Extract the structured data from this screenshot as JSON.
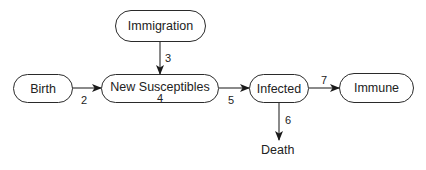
{
  "diagram": {
    "nodes": [
      {
        "id": "birth",
        "label": "Birth"
      },
      {
        "id": "immigration",
        "label": "Immigration"
      },
      {
        "id": "new_susceptibles",
        "label": "New Susceptibles"
      },
      {
        "id": "infected",
        "label": "Infected"
      },
      {
        "id": "immune",
        "label": "Immune"
      },
      {
        "id": "death",
        "label": "Death"
      }
    ],
    "edges": [
      {
        "from": "birth",
        "to": "new_susceptibles",
        "label": "2"
      },
      {
        "from": "immigration",
        "to": "new_susceptibles",
        "label": "3"
      },
      {
        "from": "new_susceptibles",
        "to": "infected",
        "label": "5"
      },
      {
        "from": "infected",
        "to": "death",
        "label": "6"
      },
      {
        "from": "infected",
        "to": "immune",
        "label": "7"
      }
    ],
    "node_annotations": {
      "new_susceptibles": "4"
    },
    "colors": {
      "stroke": "#2a2a2a",
      "text": "#222222",
      "background": "#ffffff"
    }
  }
}
